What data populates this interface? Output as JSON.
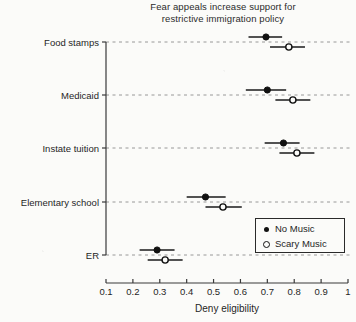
{
  "title": {
    "line1": "Fear appeals increase support for",
    "line2": "restrictive immigration policy"
  },
  "axes": {
    "xlabel": "Deny eligibility",
    "xticks": [
      "0.1",
      "0.2",
      "0.3",
      "0.4",
      "0.5",
      "0.6",
      "0.7",
      "0.8",
      "0.9",
      "1"
    ]
  },
  "legend": {
    "items": [
      {
        "label": "No Music",
        "marker": "filled-circle-icon"
      },
      {
        "label": "Scary Music",
        "marker": "open-circle-icon"
      }
    ]
  },
  "chart_data": {
    "type": "scatter",
    "title": "Fear appeals increase support for restrictive immigration policy",
    "xlabel": "Deny eligibility",
    "ylabel": "",
    "xlim": [
      0.1,
      1.0
    ],
    "xticks": [
      0.1,
      0.2,
      0.3,
      0.4,
      0.5,
      0.6,
      0.7,
      0.8,
      0.9,
      1.0
    ],
    "grid": "horizontal-dashed",
    "legend_position": "lower-right",
    "categories": [
      "Food stamps",
      "Medicaid",
      "Instate tuition",
      "Elementary school",
      "ER"
    ],
    "series": [
      {
        "name": "No Music",
        "marker": "filled-circle",
        "values": [
          0.695,
          0.7,
          0.76,
          0.47,
          0.29
        ],
        "ci_low": [
          0.63,
          0.62,
          0.69,
          0.4,
          0.225
        ],
        "ci_high": [
          0.755,
          0.77,
          0.82,
          0.545,
          0.355
        ]
      },
      {
        "name": "Scary Music",
        "marker": "open-circle",
        "values": [
          0.78,
          0.795,
          0.81,
          0.535,
          0.32
        ],
        "ci_low": [
          0.71,
          0.73,
          0.745,
          0.47,
          0.255
        ],
        "ci_high": [
          0.84,
          0.86,
          0.875,
          0.605,
          0.385
        ]
      }
    ]
  }
}
